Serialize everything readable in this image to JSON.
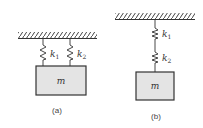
{
  "diagrams": [
    {
      "id": "a",
      "caption": "(a)",
      "arrangement": "parallel",
      "mass_label": "m",
      "springs": [
        {
          "label": "k",
          "subscript": "1"
        },
        {
          "label": "k",
          "subscript": "2"
        }
      ]
    },
    {
      "id": "b",
      "caption": "(b)",
      "arrangement": "series",
      "mass_label": "m",
      "springs": [
        {
          "label": "k",
          "subscript": "1"
        },
        {
          "label": "k",
          "subscript": "2"
        }
      ]
    }
  ],
  "colors": {
    "line": "#333333",
    "mass_fill": "#e4e4e4",
    "hatch": "#444444"
  }
}
